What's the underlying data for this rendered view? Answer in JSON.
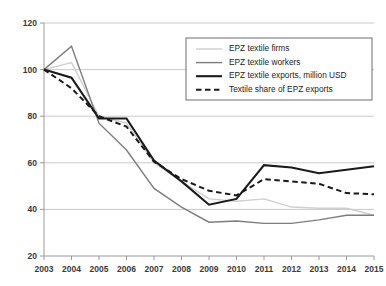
{
  "chart_data": {
    "type": "line",
    "title": "",
    "xlabel": "",
    "ylabel": "",
    "x": [
      2003,
      2004,
      2005,
      2006,
      2007,
      2008,
      2009,
      2010,
      2011,
      2012,
      2013,
      2014,
      2015
    ],
    "categories": [
      "2003",
      "2004",
      "2005",
      "2006",
      "2007",
      "2008",
      "2009",
      "2010",
      "2011",
      "2012",
      "2013",
      "2014",
      "2015"
    ],
    "ylim": [
      20,
      120
    ],
    "yticks": [
      20,
      40,
      60,
      80,
      100,
      120
    ],
    "ytick_labels": [
      "20",
      "40",
      "60",
      "80",
      "100",
      "120"
    ],
    "grid": true,
    "legend_position": "upper-right-inside",
    "series": [
      {
        "name": "EPZ textile firms",
        "color": "#cfcfcf",
        "style": "solid-thin",
        "values": [
          100,
          103,
          80,
          77,
          60,
          52,
          44.5,
          43.5,
          44.5,
          41,
          40.5,
          40.5,
          37.5
        ]
      },
      {
        "name": "EPZ textile workers",
        "color": "#7d7d7d",
        "style": "solid-medium",
        "values": [
          100,
          110,
          77,
          65.5,
          49,
          41,
          34.5,
          35,
          34,
          34,
          35.5,
          37.5,
          37.5
        ]
      },
      {
        "name": "EPZ textile exports, million USD",
        "color": "#1a1a1a",
        "style": "solid-thick",
        "values": [
          100,
          96.5,
          79,
          79,
          61,
          52,
          42,
          44.5,
          59,
          58,
          55.5,
          57,
          58.5
        ]
      },
      {
        "name": "Textile share of EPZ exports",
        "color": "#1a1a1a",
        "style": "dashed",
        "values": [
          100,
          92,
          80,
          75.5,
          60.5,
          53,
          48,
          46,
          53,
          52,
          51,
          47,
          46.5
        ]
      }
    ]
  },
  "legend": {
    "items": [
      {
        "label": "EPZ textile firms"
      },
      {
        "label": "EPZ textile workers"
      },
      {
        "label": "EPZ textile exports, million USD"
      },
      {
        "label": "Textile share of EPZ exports"
      }
    ]
  },
  "axes": {
    "y_ticks": [
      "120",
      "100",
      "80",
      "60",
      "40",
      "20"
    ],
    "x_ticks": [
      "2003",
      "2004",
      "2005",
      "2006",
      "2007",
      "2008",
      "2009",
      "2010",
      "2011",
      "2012",
      "2013",
      "2014",
      "2015"
    ]
  },
  "colors": {
    "grid": "#c9c9c9",
    "axis": "#9a9a9a",
    "firms": "#cfcfcf",
    "workers": "#7d7d7d",
    "exports": "#1a1a1a",
    "share": "#1a1a1a",
    "background": "#ffffff"
  }
}
